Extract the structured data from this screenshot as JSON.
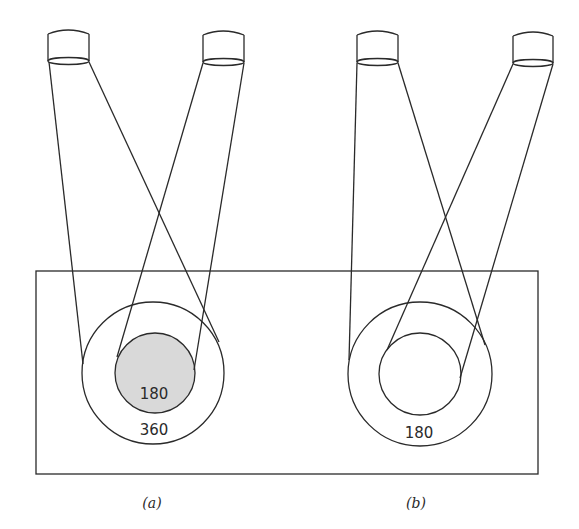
{
  "colors": {
    "stroke": "#2a2a2a",
    "background": "#ffffff",
    "shaded_overlap": "#d9d9d9"
  },
  "panels": [
    {
      "label": "(a)",
      "outer_circle_value": "360",
      "inner_circle_value": "180",
      "inner_shaded": true,
      "cameras": [
        "camera-left",
        "camera-right"
      ]
    },
    {
      "label": "(b)",
      "outer_circle_value": "180",
      "inner_circle_value": "",
      "inner_shaded": false,
      "cameras": [
        "camera-left",
        "camera-right"
      ]
    }
  ],
  "icons": {
    "camera": "cylinder-spotlight-icon"
  }
}
